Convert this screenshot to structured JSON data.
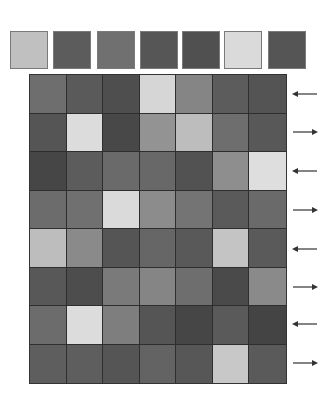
{
  "palette": {
    "swatches": [
      {
        "color": "#c0c0c0"
      },
      {
        "color": "#5c5c5c"
      },
      {
        "color": "#707070"
      },
      {
        "color": "#565656"
      },
      {
        "color": "#505050"
      },
      {
        "color": "#dadada"
      },
      {
        "color": "#555555"
      }
    ]
  },
  "board": {
    "rows": 8,
    "cols": 7,
    "cells": [
      [
        "#6e6e6e",
        "#5a5a5a",
        "#4e4e4e",
        "#d6d6d6",
        "#858585",
        "#5c5c5c",
        "#545454"
      ],
      [
        "#555555",
        "#dcdcdc",
        "#484848",
        "#939393",
        "#bdbdbd",
        "#6e6e6e",
        "#585858"
      ],
      [
        "#464646",
        "#5c5c5c",
        "#6a6a6a",
        "#686868",
        "#525252",
        "#8e8e8e",
        "#dedede"
      ],
      [
        "#6c6c6c",
        "#707070",
        "#dadada",
        "#8c8c8c",
        "#747474",
        "#5a5a5a",
        "#6a6a6a"
      ],
      [
        "#bdbdbd",
        "#8a8a8a",
        "#555555",
        "#666666",
        "#595959",
        "#c4c4c4",
        "#5a5a5a"
      ],
      [
        "#585858",
        "#4d4d4d",
        "#7a7a7a",
        "#858585",
        "#6e6e6e",
        "#4a4a4a",
        "#8a8a8a"
      ],
      [
        "#6c6c6c",
        "#dcdcdc",
        "#7e7e7e",
        "#555555",
        "#464646",
        "#5a5a5a",
        "#444444"
      ],
      [
        "#5e5e5e",
        "#5e5e5e",
        "#555555",
        "#636363",
        "#575757",
        "#c8c8c8",
        "#5a5a5a"
      ]
    ]
  },
  "row_arrows": [
    {
      "direction": "left"
    },
    {
      "direction": "right"
    },
    {
      "direction": "left"
    },
    {
      "direction": "right"
    },
    {
      "direction": "left"
    },
    {
      "direction": "right"
    },
    {
      "direction": "left"
    },
    {
      "direction": "right"
    }
  ],
  "colors": {
    "background": "#ffffff",
    "grid_line": "#2e2e2e",
    "arrow": "#333333"
  }
}
